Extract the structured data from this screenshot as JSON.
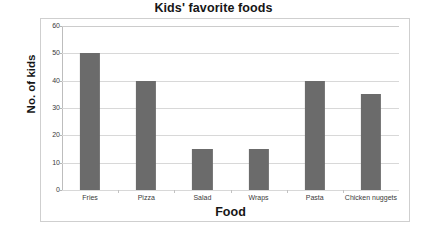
{
  "chart_data": {
    "type": "bar",
    "title": "Kids' favorite foods",
    "xlabel": "Food",
    "ylabel": "No. of kids",
    "categories": [
      "Fries",
      "Pizza",
      "Salad",
      "Wraps",
      "Pasta",
      "Chicken nuggets"
    ],
    "values": [
      50,
      40,
      15,
      15,
      40,
      35
    ],
    "ylim": [
      0,
      60
    ],
    "ytick_labels": [
      "0",
      "10",
      "20",
      "30",
      "40",
      "50",
      "60"
    ],
    "ytick_values": [
      0,
      10,
      20,
      30,
      40,
      50,
      60
    ],
    "grid": "horizontal",
    "legend": "none",
    "bar_color": "#6b6b6b",
    "gridline_color": "#d8d8d8",
    "frame_color": "#cfcfcf",
    "background_color": "#ffffff"
  }
}
